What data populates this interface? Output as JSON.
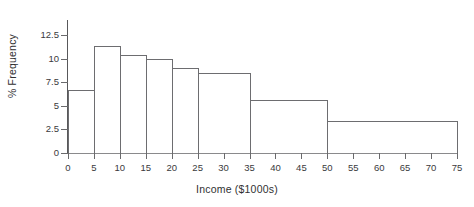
{
  "chart_data": {
    "type": "bar",
    "title": "",
    "subtitle": "",
    "xlabel": "Income ($1000s)",
    "ylabel": "% Frequency",
    "xlim": [
      0,
      75
    ],
    "ylim": [
      0,
      13.2
    ],
    "grid": false,
    "legend": null,
    "bin_edges": [
      0,
      5,
      10,
      15,
      20,
      25,
      35,
      50,
      75
    ],
    "categories": [
      "0-5",
      "5-10",
      "10-15",
      "15-20",
      "20-25",
      "25-35",
      "35-50",
      "50-75"
    ],
    "values": [
      6.7,
      11.3,
      10.4,
      10.0,
      9.0,
      8.5,
      5.6,
      3.4
    ],
    "bars": [
      {
        "label": "0-5",
        "start": 0,
        "end": 5,
        "value": 6.7
      },
      {
        "label": "5-10",
        "start": 5,
        "end": 10,
        "value": 11.3
      },
      {
        "label": "10-15",
        "start": 10,
        "end": 15,
        "value": 10.4
      },
      {
        "label": "15-20",
        "start": 15,
        "end": 20,
        "value": 10.0
      },
      {
        "label": "20-25",
        "start": 20,
        "end": 25,
        "value": 9.0
      },
      {
        "label": "25-35",
        "start": 25,
        "end": 35,
        "value": 8.5
      },
      {
        "label": "35-50",
        "start": 35,
        "end": 50,
        "value": 5.6
      },
      {
        "label": "50-75",
        "start": 50,
        "end": 75,
        "value": 3.4
      }
    ],
    "x_ticks": [
      0,
      5,
      10,
      15,
      20,
      25,
      30,
      35,
      40,
      45,
      50,
      55,
      60,
      65,
      70,
      75
    ],
    "x_tick_labels": [
      "0",
      "5",
      "10",
      "15",
      "20",
      "25",
      "30",
      "35",
      "40",
      "45",
      "50",
      "55",
      "60",
      "65",
      "70",
      "75"
    ],
    "y_ticks": [
      0,
      2.5,
      5,
      7.5,
      10,
      12.5
    ],
    "y_tick_labels": [
      "0",
      "2.5",
      "5",
      "7.5",
      "10",
      "12.5"
    ],
    "colors": {
      "bar_outline": "#6d6d70",
      "axis": "#58585a",
      "tick": "#6a6a6c",
      "text": "#2f2f31",
      "background": "#ffffff"
    }
  }
}
